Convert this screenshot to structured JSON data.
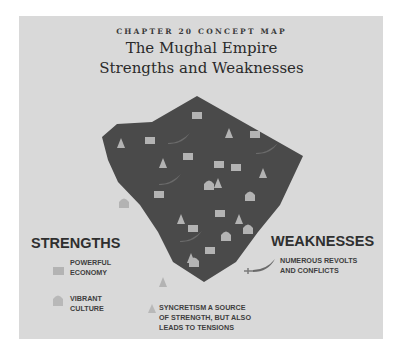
{
  "header": {
    "kicker": "CHAPTER 20 CONCEPT MAP",
    "title_line1": "The Mughal Empire",
    "title_line2": "Strengths and Weaknesses"
  },
  "colors": {
    "background": "#d9d9d9",
    "map_fill": "#4a4a4a",
    "icon_fill": "#b3b3b3",
    "sword": "#6a6a6a"
  },
  "map": {
    "icons": {
      "economy_squares": [
        [
          197,
          116
        ],
        [
          150,
          141
        ],
        [
          255,
          135
        ],
        [
          188,
          157
        ],
        [
          219,
          165
        ],
        [
          236,
          168
        ],
        [
          159,
          195
        ],
        [
          220,
          214
        ],
        [
          193,
          229
        ],
        [
          210,
          251
        ]
      ],
      "culture_temples": [
        [
          124,
          203
        ],
        [
          209,
          185
        ],
        [
          250,
          196
        ],
        [
          226,
          236
        ],
        [
          248,
          229
        ],
        [
          194,
          262
        ]
      ],
      "syncretism_triangles": [
        [
          121,
          143
        ],
        [
          229,
          133
        ],
        [
          163,
          163
        ],
        [
          263,
          173
        ],
        [
          218,
          183
        ],
        [
          181,
          219
        ],
        [
          239,
          219
        ],
        [
          191,
          258
        ],
        [
          163,
          282
        ]
      ]
    },
    "swords": [
      [
        180,
        139
      ],
      [
        268,
        149
      ],
      [
        171,
        180
      ],
      [
        192,
        237
      ]
    ]
  },
  "legend": {
    "strengths": {
      "heading": "STRENGTHS",
      "items": [
        {
          "icon": "economy-square",
          "line1": "POWERFUL",
          "line2": "ECONOMY"
        },
        {
          "icon": "culture-temple",
          "line1": "VIBRANT",
          "line2": "CULTURE"
        }
      ]
    },
    "weaknesses": {
      "heading": "WEAKNESSES",
      "items": [
        {
          "icon": "sword",
          "line1": "NUMEROUS REVOLTS",
          "line2": "AND CONFLICTS"
        }
      ]
    },
    "syncretism": {
      "icon": "syncretism-triangle",
      "line1": "SYNCRETISM A SOURCE",
      "line2": "OF STRENGTH, BUT ALSO",
      "line3": "LEADS TO TENSIONS"
    }
  }
}
